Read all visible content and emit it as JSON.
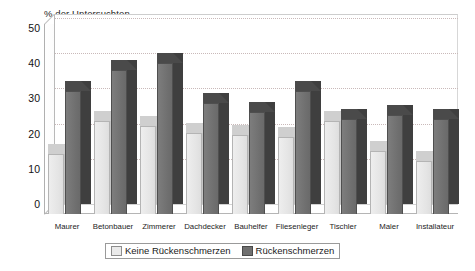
{
  "chart_data": {
    "type": "bar",
    "title": "% der Untersuchten",
    "xlabel": "",
    "ylabel": "",
    "ylim": [
      0,
      50
    ],
    "yticks": [
      50,
      40,
      30,
      20,
      10,
      0
    ],
    "grid": true,
    "grid_style": "dotted horizontal",
    "legend_position": "bottom-center",
    "style": "3d-column",
    "categories": [
      "Maurer",
      "Betonbauer",
      "Zimmerer",
      "Dachdecker",
      "Bauhelfer",
      "Fliesenleger",
      "Tischler",
      "Maler",
      "Installateur"
    ],
    "series": [
      {
        "name": "Keine Rückenschmerzen",
        "color": "#e8e8e8",
        "values": [
          17,
          26.5,
          25,
          23,
          22.5,
          22,
          26.5,
          18,
          15
        ]
      },
      {
        "name": "Rückenschmerzen",
        "color": "#6f6f6f",
        "values": [
          35,
          41,
          43,
          31.5,
          29,
          35,
          27,
          28,
          27
        ]
      }
    ]
  },
  "legend": {
    "items": [
      {
        "label": "Keine Rückenschmerzen",
        "swatch": "light"
      },
      {
        "label": "Rückenschmerzen",
        "swatch": "dark"
      }
    ]
  },
  "caption": {
    "text": ""
  }
}
